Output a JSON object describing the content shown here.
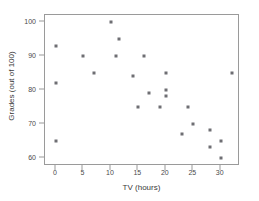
{
  "chart_data": {
    "type": "scatter",
    "title": "",
    "xlabel": "TV (hours)",
    "ylabel": "Grades (out of 100)",
    "xlim": [
      -2,
      33.5
    ],
    "ylim": [
      57.5,
      102
    ],
    "xticks": [
      0,
      5,
      10,
      15,
      20,
      25,
      30
    ],
    "xtick_labels": [
      "0",
      "5",
      "10",
      "15",
      "20",
      "25",
      "30"
    ],
    "yticks": [
      60,
      70,
      80,
      90,
      100
    ],
    "ytick_labels": [
      "60",
      "70",
      "80",
      "90",
      "100"
    ],
    "grid": false,
    "legend": false,
    "marker_color": "#6e6e73",
    "axis_color": "#9a9a9a",
    "points": [
      {
        "x": 0,
        "y": 93
      },
      {
        "x": 0,
        "y": 82
      },
      {
        "x": 0,
        "y": 65
      },
      {
        "x": 5,
        "y": 90
      },
      {
        "x": 7,
        "y": 85
      },
      {
        "x": 10,
        "y": 100
      },
      {
        "x": 11,
        "y": 90
      },
      {
        "x": 11.5,
        "y": 95
      },
      {
        "x": 14,
        "y": 84
      },
      {
        "x": 15,
        "y": 75
      },
      {
        "x": 16,
        "y": 90
      },
      {
        "x": 17,
        "y": 79
      },
      {
        "x": 19,
        "y": 75
      },
      {
        "x": 20,
        "y": 85
      },
      {
        "x": 20,
        "y": 80
      },
      {
        "x": 20,
        "y": 78
      },
      {
        "x": 23,
        "y": 67
      },
      {
        "x": 24,
        "y": 75
      },
      {
        "x": 25,
        "y": 70
      },
      {
        "x": 28,
        "y": 68
      },
      {
        "x": 28,
        "y": 63
      },
      {
        "x": 30,
        "y": 65
      },
      {
        "x": 30,
        "y": 60
      },
      {
        "x": 32,
        "y": 85
      }
    ]
  }
}
